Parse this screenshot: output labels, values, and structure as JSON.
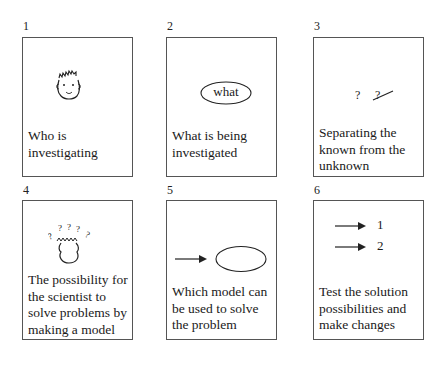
{
  "panels": [
    {
      "number": "1",
      "icon": "smiling-face-icon",
      "caption": "Who is investigating"
    },
    {
      "number": "2",
      "icon": "what-ellipse-icon",
      "ellipse_text": "what",
      "caption": "What is being investigated"
    },
    {
      "number": "3",
      "icon": "question-marks-icon",
      "symbols": [
        "?",
        "?"
      ],
      "caption": "Separating the known from the unknown"
    },
    {
      "number": "4",
      "icon": "thinking-head-icon",
      "caption": "The possibility for the scientist to solve problems by making a model"
    },
    {
      "number": "5",
      "icon": "arrow-to-ellipse-icon",
      "caption": "Which model can be used to solve the problem"
    },
    {
      "number": "6",
      "icon": "two-arrows-icon",
      "arrow_labels": [
        "1",
        "2"
      ],
      "caption": "Test the solution possibilities and make changes"
    }
  ]
}
